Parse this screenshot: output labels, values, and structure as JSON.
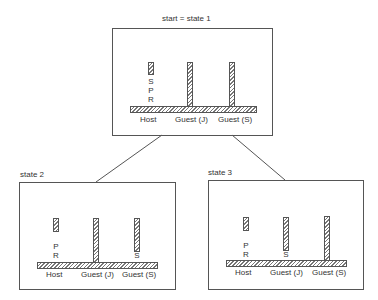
{
  "diagram": {
    "connectors": [
      {
        "from": "state1",
        "to": "state2"
      },
      {
        "from": "state1",
        "to": "state3"
      }
    ],
    "states": [
      {
        "id": "state1",
        "title": "start = state 1",
        "labels": {
          "host": "Host",
          "guest_j": "Guest (J)",
          "guest_s": "Guest (S)"
        },
        "pegs": {
          "host": [
            "S",
            "P",
            "R"
          ],
          "guest_j": [],
          "guest_s": []
        }
      },
      {
        "id": "state2",
        "title": "state 2",
        "labels": {
          "host": "Host",
          "guest_j": "Guest (J)",
          "guest_s": "Guest (S)"
        },
        "pegs": {
          "host": [
            "P",
            "R"
          ],
          "guest_j": [],
          "guest_s": [
            "S"
          ]
        }
      },
      {
        "id": "state3",
        "title": "state 3",
        "labels": {
          "host": "Host",
          "guest_j": "Guest (J)",
          "guest_s": "Guest (S)"
        },
        "pegs": {
          "host": [
            "P",
            "R"
          ],
          "guest_j": [
            "S"
          ],
          "guest_s": []
        }
      }
    ]
  }
}
